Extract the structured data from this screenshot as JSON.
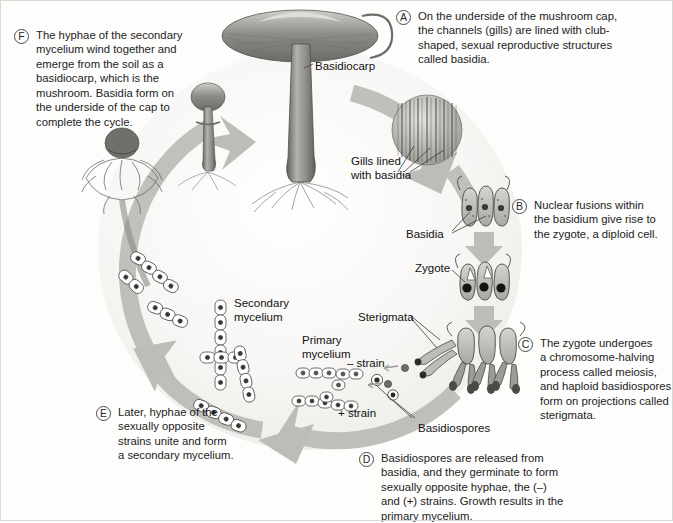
{
  "figure": {
    "background_color": "#fdfdfc",
    "arrow_color": "#b7b7b2",
    "ink_color": "#1c1c1c"
  },
  "callouts": [
    {
      "key": "F",
      "badge": "F",
      "text": "The hyphae of the secondary\nmycelium wind together and\nemerge from the soil as a\nbasidiocarp, which is the\nmushroom. Basidia form on\nthe underside of the cap to\ncomplete the cycle.",
      "x": 14,
      "y": 28,
      "width": 185
    },
    {
      "key": "A",
      "badge": "A",
      "text": "On the underside of the mushroom cap,\nthe channels (gills) are lined with club-\nshaped, sexual reproductive structures\ncalled basidia.",
      "x": 396,
      "y": 9,
      "width": 272
    },
    {
      "key": "B",
      "badge": "B",
      "text": "Nuclear fusions within\nthe basidium give rise to\nthe zygote, a diploid cell.",
      "x": 512,
      "y": 198,
      "width": 160
    },
    {
      "key": "C",
      "badge": "C",
      "text": "The zygote undergoes\na chromosome-halving\nprocess called meiosis,\nand haploid basidiospores\nform on projections called\nsterigmata.",
      "x": 518,
      "y": 336,
      "width": 155
    },
    {
      "key": "D",
      "badge": "D",
      "text": "Basidiospores are released from\nbasidia, and they germinate to form\nsexually opposite hyphae, the (–)\nand (+) strains. Growth results in the\nprimary mycelium.",
      "x": 359,
      "y": 451,
      "width": 255
    },
    {
      "key": "E",
      "badge": "E",
      "text": "Later, hyphae of the\nsexually opposite\nstrains unite and form\na secondary mycelium.",
      "x": 96,
      "y": 405,
      "width": 165
    }
  ],
  "figure_labels": [
    {
      "key": "basidiocarp",
      "text": "Basidiocarp",
      "x": 315,
      "y": 60
    },
    {
      "key": "gills",
      "text": "Gills lined\nwith basidia",
      "x": 351,
      "y": 155
    },
    {
      "key": "basidia",
      "text": "Basidia",
      "x": 406,
      "y": 228
    },
    {
      "key": "zygote",
      "text": "Zygote",
      "x": 415,
      "y": 262
    },
    {
      "key": "sterigmata",
      "text": "Sterigmata",
      "x": 358,
      "y": 311
    },
    {
      "key": "secondary-mycelium",
      "text": "Secondary\nmycelium",
      "x": 234,
      "y": 297
    },
    {
      "key": "primary-mycelium",
      "text": "Primary\nmycelium",
      "x": 302,
      "y": 334
    },
    {
      "key": "minus-strain",
      "text": "– strain",
      "x": 347,
      "y": 357
    },
    {
      "key": "plus-strain",
      "text": "+ strain",
      "x": 338,
      "y": 407
    },
    {
      "key": "basidiospores",
      "text": "Basidiospores",
      "x": 418,
      "y": 422
    }
  ]
}
